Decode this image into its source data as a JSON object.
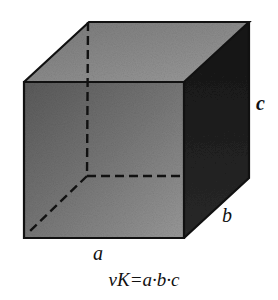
{
  "figure": {
    "type": "rectangular cuboid (box) with hidden edges dashed",
    "labels": {
      "edge_a": "a",
      "edge_b": "b",
      "edge_c": "c"
    },
    "formula": "vK=a·b·c",
    "colors": {
      "front_face": "#6e6e6e",
      "top_face": "#8a8a8a",
      "side_face": "#1e1e1e",
      "edges": "#111111",
      "background": "#ffffff"
    }
  }
}
